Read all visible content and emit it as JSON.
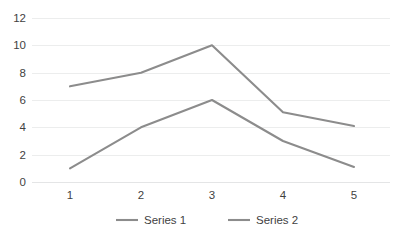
{
  "chart_data": {
    "type": "line",
    "title": "",
    "subtitle": "",
    "xlabel": "",
    "ylabel": "",
    "x": [
      1,
      2,
      3,
      4,
      5
    ],
    "categories": [
      "1",
      "2",
      "3",
      "4",
      "5"
    ],
    "series": [
      {
        "name": "Series 1",
        "values": [
          1,
          4,
          6,
          3,
          1.1
        ],
        "color": "#8c8c8c"
      },
      {
        "name": "Series 2",
        "values": [
          7,
          8,
          10,
          5.1,
          4.1
        ],
        "color": "#8c8c8c"
      }
    ],
    "ylim": [
      0,
      12
    ],
    "yticks": [
      0,
      2,
      4,
      6,
      8,
      10,
      12
    ],
    "ytick_labels": [
      "0",
      "2",
      "4",
      "6",
      "8",
      "10",
      "12"
    ],
    "xtick_labels": [
      "1",
      "2",
      "3",
      "4",
      "5"
    ],
    "grid": "horizontal",
    "gridline_color": "#eceded",
    "axis_color": "#e4e5e6",
    "tick_label_color": "#3f3f3f",
    "background": "#ffffff",
    "legend": {
      "position": "bottom",
      "entries": [
        {
          "label": "Series 1",
          "color": "#8c8c8c"
        },
        {
          "label": "Series 2",
          "color": "#8c8c8c"
        }
      ]
    }
  }
}
